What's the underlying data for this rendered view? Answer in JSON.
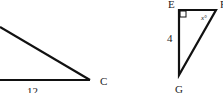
{
  "diagram": {
    "left_triangle": {
      "base_label": "12",
      "vertex_label": "C"
    },
    "right_triangle": {
      "vertex_labels": {
        "top_left": "E",
        "top_right": "F",
        "bottom": "G"
      },
      "side_label": "4",
      "angle_label": "x°",
      "right_angle_at": "E"
    },
    "stroke_color": "#111111"
  }
}
